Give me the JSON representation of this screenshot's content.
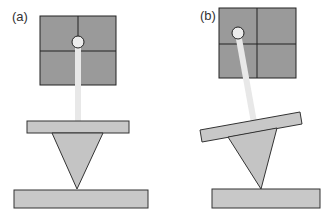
{
  "figure": {
    "panels": [
      {
        "label": "(a)",
        "state": "cantilever level, laser spot centered on photodetector"
      },
      {
        "label": "(b)",
        "state": "cantilever tilted, laser spot deflected to upper-left quadrant"
      }
    ],
    "colors": {
      "detector": "#9a9a9a",
      "detector_lines": "#222222",
      "laser_beam": "#e8e8e8",
      "cantilever": "#c8c8c8",
      "tip": "#c4c4c4",
      "sample": "#c8c8c8",
      "outline": "#333333"
    }
  }
}
